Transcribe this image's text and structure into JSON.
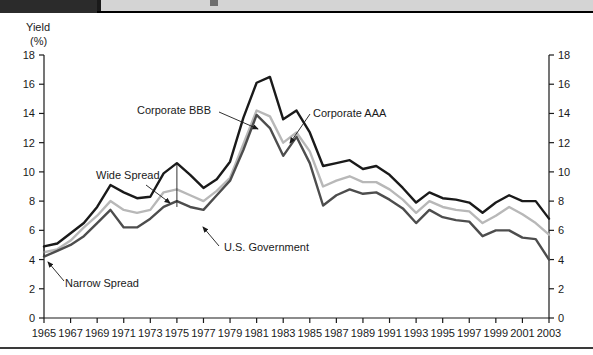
{
  "window": {
    "titlebar_left_color": "#2b2b2b",
    "titlebar_right_color": "#d4d4d4"
  },
  "chart_data": {
    "type": "line",
    "title": "",
    "ylabel_line1": "Yield",
    "ylabel_line2": "(%)",
    "xlabel": "",
    "ylim": [
      0,
      18
    ],
    "ytick_step": 2,
    "yticks": [
      "0",
      "2",
      "4",
      "6",
      "8",
      "10",
      "12",
      "14",
      "16",
      "18"
    ],
    "xlim": [
      1965,
      2003
    ],
    "xticks": [
      "1965",
      "1967",
      "1969",
      "1971",
      "1973",
      "1975",
      "1977",
      "1979",
      "1981",
      "1983",
      "1985",
      "1987",
      "1989",
      "1991",
      "1993",
      "1995",
      "1997",
      "1999",
      "2001",
      "2003"
    ],
    "grid": false,
    "legend_position": "none",
    "dual_y_axis": true,
    "x": [
      1965,
      1966,
      1967,
      1968,
      1969,
      1970,
      1971,
      1972,
      1973,
      1974,
      1975,
      1976,
      1977,
      1978,
      1979,
      1980,
      1981,
      1982,
      1983,
      1984,
      1985,
      1986,
      1987,
      1988,
      1989,
      1990,
      1991,
      1992,
      1993,
      1994,
      1995,
      1996,
      1997,
      1998,
      1999,
      2000,
      2001,
      2002,
      2003
    ],
    "series": [
      {
        "name": "Corporate BBB",
        "color": "#1a1a1a",
        "width": 2.4,
        "values": [
          4.9,
          5.1,
          5.8,
          6.5,
          7.6,
          9.1,
          8.6,
          8.2,
          8.3,
          9.9,
          10.6,
          9.8,
          8.9,
          9.5,
          10.7,
          13.7,
          16.1,
          16.5,
          13.6,
          14.2,
          12.7,
          10.4,
          10.6,
          10.8,
          10.2,
          10.4,
          9.8,
          8.9,
          7.9,
          8.6,
          8.2,
          8.1,
          7.9,
          7.2,
          7.9,
          8.4,
          8.0,
          8.0,
          6.8
        ]
      },
      {
        "name": "Corporate AAA",
        "color": "#b8b8b8",
        "width": 2.4,
        "values": [
          4.5,
          4.7,
          5.3,
          6.2,
          7.0,
          8.0,
          7.4,
          7.2,
          7.4,
          8.6,
          8.8,
          8.4,
          8.0,
          8.7,
          9.6,
          11.9,
          14.2,
          13.8,
          12.0,
          12.7,
          11.4,
          9.0,
          9.4,
          9.7,
          9.3,
          9.3,
          8.8,
          8.1,
          7.2,
          8.0,
          7.6,
          7.4,
          7.3,
          6.5,
          7.0,
          7.6,
          7.1,
          6.5,
          5.7
        ]
      },
      {
        "name": "U.S. Government",
        "color": "#4d4d4d",
        "width": 2.4,
        "values": [
          4.2,
          4.6,
          5.0,
          5.6,
          6.5,
          7.4,
          6.2,
          6.2,
          6.8,
          7.6,
          8.0,
          7.6,
          7.4,
          8.4,
          9.4,
          11.5,
          13.9,
          13.0,
          11.1,
          12.4,
          10.6,
          7.7,
          8.4,
          8.8,
          8.5,
          8.6,
          8.1,
          7.5,
          6.5,
          7.4,
          6.9,
          6.7,
          6.6,
          5.6,
          6.0,
          6.0,
          5.5,
          5.4,
          4.0
        ]
      }
    ],
    "annotations": [
      {
        "id": "corporate-bbb",
        "text": "Corporate BBB",
        "x": 137,
        "y": 101,
        "arrow": {
          "x1": 219,
          "y1": 99,
          "x2": 258,
          "y2": 116
        }
      },
      {
        "id": "corporate-aaa",
        "text": "Corporate AAA",
        "x": 313,
        "y": 104,
        "arrow": {
          "x1": 310,
          "y1": 101,
          "x2": 290,
          "y2": 130
        }
      },
      {
        "id": "wide-spread",
        "text": "Wide Spread",
        "x": 96,
        "y": 166,
        "arrow": {
          "x1": 146,
          "y1": 172,
          "x2": 170,
          "y2": 190
        }
      },
      {
        "id": "narrow-spread",
        "text": "Narrow Spread",
        "x": 65,
        "y": 274,
        "arrow": {
          "x1": 64,
          "y1": 268,
          "x2": 48,
          "y2": 249
        }
      },
      {
        "id": "us-government",
        "text": "U.S. Government",
        "x": 224,
        "y": 238,
        "arrow": {
          "x1": 219,
          "y1": 233,
          "x2": 203,
          "y2": 214
        }
      }
    ],
    "spread_markers": [
      {
        "id": "wide-spread-bar",
        "x": 1975,
        "y_top": 10.6,
        "y_bottom": 7.6
      },
      {
        "id": "narrow-spread-bar",
        "x": 1965,
        "y_top": 4.9,
        "y_bottom": 4.2
      }
    ]
  }
}
